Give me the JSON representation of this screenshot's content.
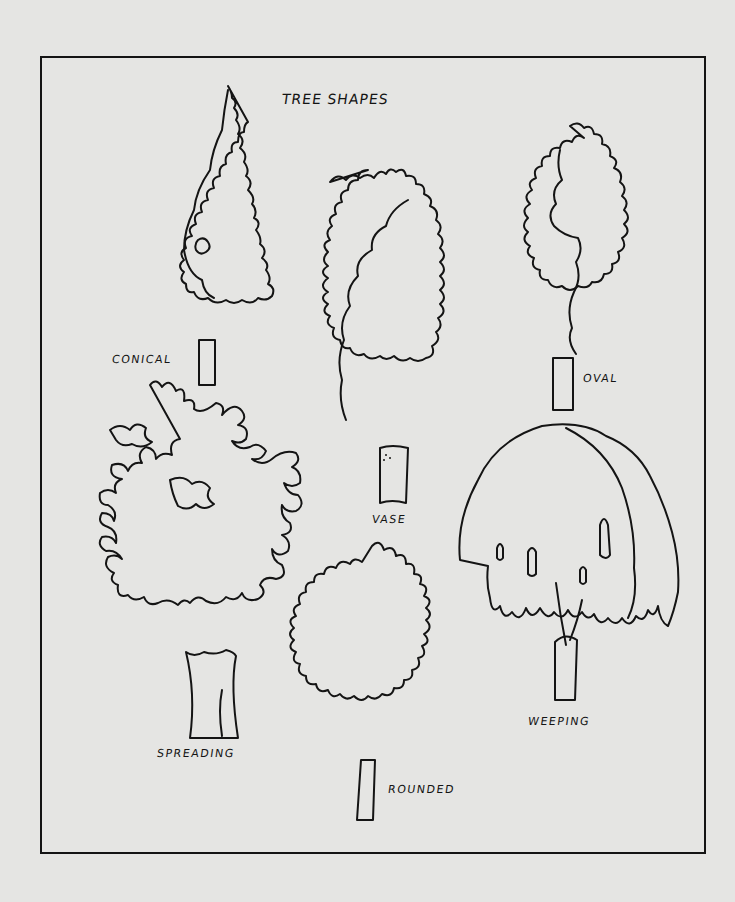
{
  "title": "TREE SHAPES",
  "colors": {
    "background": "#e5e5e3",
    "ink": "#141414"
  },
  "trees": [
    {
      "id": "conical",
      "label": "CONICAL"
    },
    {
      "id": "vase",
      "label": "VASE"
    },
    {
      "id": "oval",
      "label": "OVAL"
    },
    {
      "id": "spreading",
      "label": "SPREADING"
    },
    {
      "id": "rounded",
      "label": "ROUNDED"
    },
    {
      "id": "weeping",
      "label": "WEEPING"
    }
  ]
}
